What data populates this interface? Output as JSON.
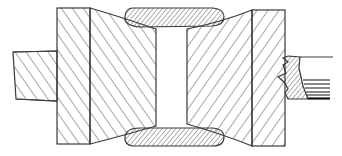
{
  "figure": {
    "type": "mechanical cross-section drawing",
    "colors": {
      "line": "#3a3a3a",
      "background": "#ffffff",
      "thick_line": "#111111"
    },
    "parts": [
      {
        "id": "left-shaft",
        "label": ""
      },
      {
        "id": "left-flange",
        "label": ""
      },
      {
        "id": "left-tapered-hub",
        "label": ""
      },
      {
        "id": "top-ring-section",
        "label": ""
      },
      {
        "id": "bottom-ring-section",
        "label": ""
      },
      {
        "id": "right-tapered-hub",
        "label": ""
      },
      {
        "id": "right-flange",
        "label": ""
      },
      {
        "id": "right-shaft-break",
        "label": ""
      }
    ]
  }
}
